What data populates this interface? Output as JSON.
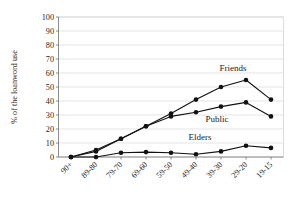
{
  "chart_data": {
    "type": "line",
    "title": "",
    "subtitle": "",
    "xlabel": "",
    "ylabel": "% of the loanword use",
    "categories": [
      "90+",
      "89-80",
      "79-70",
      "69-60",
      "59-50",
      "49-40",
      "39-30",
      "29-20",
      "19-15"
    ],
    "ylim": [
      0,
      100
    ],
    "yticks": [
      "0",
      "10",
      "20",
      "30",
      "40",
      "50",
      "60",
      "70",
      "80",
      "90",
      "100"
    ],
    "grid": true,
    "legend_position": "inline-annotations",
    "series": [
      {
        "name": "Friends",
        "values": [
          0,
          5,
          13,
          22,
          31,
          41,
          50,
          55,
          41
        ],
        "color": "#111111",
        "marker": "circle"
      },
      {
        "name": "Public",
        "values": [
          0,
          4,
          13,
          22,
          29,
          32,
          36,
          39,
          29
        ],
        "color": "#111111",
        "marker": "circle"
      },
      {
        "name": "Elders",
        "values": [
          0,
          0,
          3,
          3.5,
          3,
          2,
          4,
          8,
          6.5
        ],
        "color": "#111111",
        "marker": "circle"
      }
    ],
    "annotations": [
      {
        "text": "Friends",
        "series": "Friends"
      },
      {
        "text": "Public",
        "series": "Public"
      },
      {
        "text": "Elders",
        "series": "Elders"
      }
    ]
  }
}
